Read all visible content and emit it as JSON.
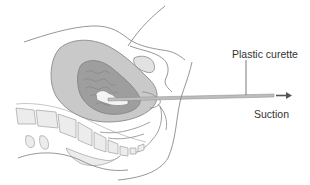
{
  "figure": {
    "labels": {
      "curette": "Plastic curette",
      "suction": "Suction"
    },
    "colors": {
      "outline": "#8a8a8a",
      "uterus_wall": "#c9c9c9",
      "endometrium": "#9e9e9e",
      "cavity_tissue": "#8c8c8c",
      "bladder": "#e2e2e2",
      "spine": "#ececec",
      "curette": "#bdbdbd",
      "arrow": "#555555",
      "background": "#ffffff"
    }
  }
}
